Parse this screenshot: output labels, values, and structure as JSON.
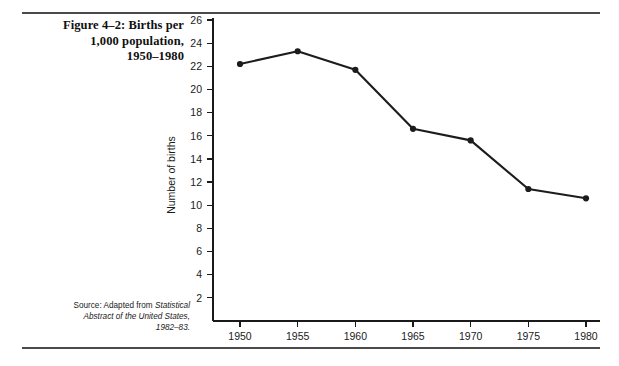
{
  "figure": {
    "title_lines": [
      "Figure 4–2: Births per",
      "1,000 population,",
      "1950–1980"
    ],
    "source_prefix": "Source: Adapted from ",
    "source_italic_1": "Statistical",
    "source_italic_2": "Abstract of the United States,",
    "source_italic_3": "1982–83."
  },
  "chart_data": {
    "type": "line",
    "title": "Figure 4–2: Births per 1,000 population, 1950–1980",
    "xlabel": "",
    "ylabel": "Number of births",
    "categories": [
      "1950",
      "1955",
      "1960",
      "1965",
      "1970",
      "1975",
      "1980"
    ],
    "x": [
      1950,
      1955,
      1960,
      1965,
      1970,
      1975,
      1980
    ],
    "values": [
      22.2,
      23.3,
      21.7,
      16.6,
      15.6,
      11.4,
      10.6
    ],
    "series": [
      {
        "name": "Number of births",
        "values": [
          22.2,
          23.3,
          21.7,
          16.6,
          15.6,
          11.4,
          10.6
        ]
      }
    ],
    "ylim": [
      0,
      26
    ],
    "yticks": [
      2,
      4,
      6,
      8,
      10,
      12,
      14,
      16,
      18,
      20,
      22,
      24,
      26
    ],
    "ytick_labels": [
      "2",
      "4",
      "6",
      "8",
      "10",
      "12",
      "14",
      "16",
      "18",
      "20",
      "22",
      "24",
      "26"
    ],
    "xtick_labels": [
      "1950",
      "1955",
      "1960",
      "1965",
      "1970",
      "1975",
      "1980"
    ],
    "grid": false,
    "legend": "none",
    "marker": "filled-circle",
    "line_color": "#1c1c1c",
    "axis_color": "#1a1a1a"
  }
}
